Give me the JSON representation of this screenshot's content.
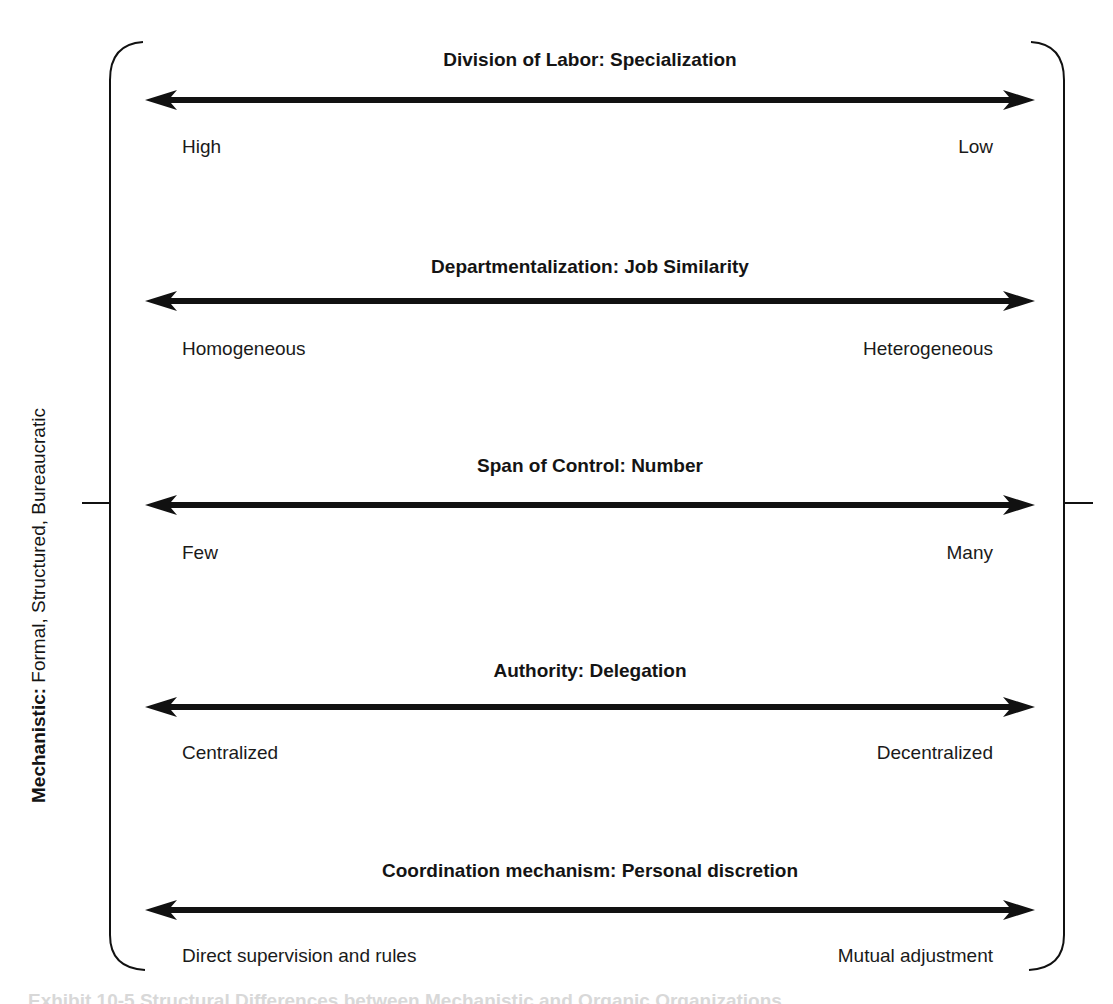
{
  "side_label": {
    "type_bold": "Mechanistic:",
    "descriptors": " Formal, Structured, Bureaucratic"
  },
  "dimensions": [
    {
      "title": "Division of Labor: Specialization",
      "left_pole": "High",
      "right_pole": "Low"
    },
    {
      "title": "Departmentalization: Job Similarity",
      "left_pole": "Homogeneous",
      "right_pole": "Heterogeneous"
    },
    {
      "title": "Span of Control: Number",
      "left_pole": "Few",
      "right_pole": "Many"
    },
    {
      "title": "Authority: Delegation",
      "left_pole": "Centralized",
      "right_pole": "Decentralized"
    },
    {
      "title": "Coordination mechanism: Personal discretion",
      "left_pole": "Direct supervision and rules",
      "right_pole": "Mutual adjustment"
    }
  ],
  "caption": "Exhibit 10-5  Structural Differences between Mechanistic and Organic Organizations",
  "colors": {
    "ink": "#111111",
    "caption_faint": "#d8d8d8",
    "background": "#ffffff"
  }
}
